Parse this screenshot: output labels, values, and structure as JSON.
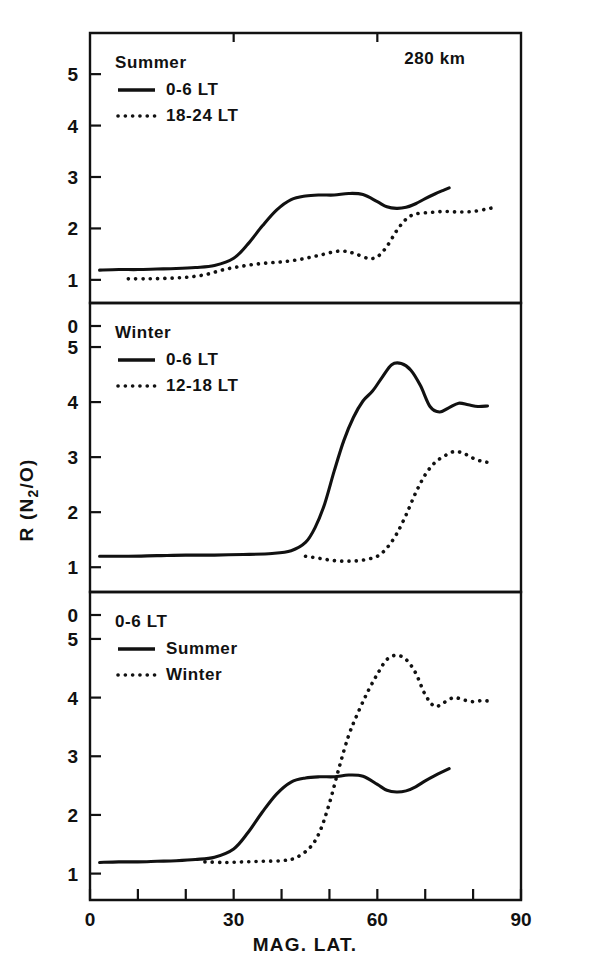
{
  "figure": {
    "ylabel": "R (N2/O)",
    "ylabel_base": "R (N",
    "ylabel_sub": "2",
    "ylabel_tail": "/O)",
    "xlabel": "MAG. LAT.",
    "altitude_annotation": "280 km",
    "ink_color": "#111111",
    "background_color": "#ffffff"
  },
  "chart_data": {
    "type": "line",
    "title": "",
    "xlabel": "MAG. LAT.",
    "ylabel": "R (N2/O)",
    "xlim": [
      0,
      90
    ],
    "ylim": [
      0,
      5.8
    ],
    "xticks": [
      0,
      10,
      20,
      30,
      40,
      50,
      60,
      70,
      80,
      90
    ],
    "xticklabels": [
      "0",
      "",
      "",
      "30",
      "",
      "",
      "60",
      "",
      "",
      "90"
    ],
    "yticks": [
      0,
      1,
      2,
      3,
      4,
      5
    ],
    "yticklabels": [
      "0",
      "1",
      "2",
      "3",
      "4",
      "5"
    ],
    "grid": false,
    "legend_position": "upper-left",
    "annotations": [
      {
        "text": "280 km",
        "panel": 0,
        "x": 72,
        "y": 5.2
      }
    ],
    "panels": [
      {
        "name": "summer",
        "label": "Summer",
        "ylim": [
          0.55,
          5.8
        ],
        "yticks": [
          1,
          2,
          3,
          4,
          5
        ],
        "legend": [
          {
            "label": "0-6 LT",
            "style": "solid"
          },
          {
            "label": "18-24 LT",
            "style": "dotted"
          }
        ],
        "series": [
          {
            "name": "0-6 LT",
            "style": "solid",
            "x": [
              2,
              6,
              10,
              14,
              18,
              22,
              26,
              30,
              33,
              36,
              39,
              42,
              45,
              48,
              51,
              54,
              57,
              60,
              62,
              64,
              66,
              68,
              70,
              72,
              74,
              75
            ],
            "y": [
              1.19,
              1.2,
              1.2,
              1.21,
              1.22,
              1.24,
              1.28,
              1.42,
              1.7,
              2.05,
              2.36,
              2.56,
              2.63,
              2.65,
              2.65,
              2.68,
              2.66,
              2.52,
              2.42,
              2.39,
              2.41,
              2.48,
              2.58,
              2.67,
              2.75,
              2.79
            ]
          },
          {
            "name": "18-24 LT",
            "style": "dotted",
            "x": [
              8,
              12,
              16,
              20,
              24,
              28,
              32,
              36,
              40,
              44,
              48,
              52,
              55,
              58,
              60,
              62,
              64,
              66,
              68,
              71,
              74,
              77,
              80,
              83,
              85
            ],
            "y": [
              1.02,
              1.02,
              1.03,
              1.05,
              1.1,
              1.2,
              1.27,
              1.32,
              1.35,
              1.4,
              1.48,
              1.56,
              1.52,
              1.42,
              1.45,
              1.65,
              1.95,
              2.18,
              2.28,
              2.31,
              2.33,
              2.32,
              2.33,
              2.38,
              2.42
            ]
          }
        ]
      },
      {
        "name": "winter",
        "label": "Winter",
        "ylim": [
          0.55,
          5.8
        ],
        "yticks": [
          1,
          2,
          3,
          4,
          5
        ],
        "legend": [
          {
            "label": "0-6 LT",
            "style": "solid"
          },
          {
            "label": "12-18 LT",
            "style": "dotted"
          }
        ],
        "series": [
          {
            "name": "0-6 LT",
            "style": "solid",
            "x": [
              2,
              8,
              14,
              20,
              26,
              32,
              38,
              42,
              45,
              47,
              49,
              51,
              53,
              55,
              57,
              59,
              61,
              63,
              65,
              67,
              69,
              71,
              73,
              75,
              77,
              79,
              81,
              83
            ],
            "y": [
              1.2,
              1.2,
              1.21,
              1.22,
              1.22,
              1.23,
              1.25,
              1.3,
              1.45,
              1.72,
              2.15,
              2.75,
              3.3,
              3.72,
              4.02,
              4.2,
              4.45,
              4.68,
              4.7,
              4.58,
              4.3,
              3.92,
              3.82,
              3.9,
              3.98,
              3.95,
              3.92,
              3.93
            ]
          },
          {
            "name": "12-18 LT",
            "style": "dotted",
            "x": [
              45,
              48,
              51,
              54,
              57,
              60,
              62,
              64,
              66,
              68,
              70,
              72,
              74,
              76,
              78,
              80,
              82,
              84
            ],
            "y": [
              1.2,
              1.16,
              1.12,
              1.11,
              1.13,
              1.2,
              1.35,
              1.6,
              1.95,
              2.35,
              2.68,
              2.9,
              3.02,
              3.1,
              3.07,
              2.98,
              2.92,
              2.9
            ]
          }
        ]
      },
      {
        "name": "combined-0-6-lt",
        "label": "0-6 LT",
        "ylim": [
          0.55,
          5.8
        ],
        "yticks": [
          1,
          2,
          3,
          4,
          5
        ],
        "legend": [
          {
            "label": "Summer",
            "style": "solid"
          },
          {
            "label": "Winter",
            "style": "dotted"
          }
        ],
        "series": [
          {
            "name": "Summer",
            "style": "solid",
            "x": [
              2,
              6,
              10,
              14,
              18,
              22,
              26,
              30,
              33,
              36,
              39,
              42,
              45,
              48,
              51,
              54,
              57,
              60,
              62,
              64,
              66,
              68,
              70,
              72,
              74,
              75
            ],
            "y": [
              1.19,
              1.2,
              1.2,
              1.21,
              1.22,
              1.24,
              1.28,
              1.42,
              1.7,
              2.05,
              2.36,
              2.56,
              2.63,
              2.65,
              2.65,
              2.68,
              2.66,
              2.52,
              2.42,
              2.39,
              2.41,
              2.48,
              2.58,
              2.67,
              2.75,
              2.79
            ]
          },
          {
            "name": "Winter",
            "style": "dotted",
            "x": [
              24,
              28,
              32,
              36,
              40,
              43,
              46,
              48,
              50,
              52,
              54,
              56,
              58,
              60,
              62,
              64,
              66,
              68,
              70,
              72,
              74,
              76,
              78,
              80,
              82,
              84
            ],
            "y": [
              1.2,
              1.19,
              1.2,
              1.21,
              1.22,
              1.27,
              1.45,
              1.72,
              2.2,
              2.8,
              3.35,
              3.75,
              4.1,
              4.4,
              4.65,
              4.72,
              4.65,
              4.42,
              4.05,
              3.85,
              3.92,
              4.0,
              3.96,
              3.93,
              3.95,
              3.93
            ]
          }
        ]
      }
    ]
  }
}
